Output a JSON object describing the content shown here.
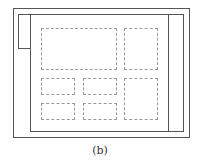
{
  "caption": "(b)",
  "colors": {
    "frame": "#555555",
    "dashed": "#999999",
    "background": "#ffffff"
  },
  "frames": {
    "outer": {
      "x": 13,
      "y": 8,
      "w": 177,
      "h": 130
    },
    "inner": {
      "x": 30,
      "y": 14,
      "w": 154,
      "h": 118
    },
    "tab": {
      "x": 18,
      "y": 14,
      "w": 13,
      "h": 35
    },
    "divider_x": 168
  },
  "dashed_boxes": [
    {
      "name": "large-block",
      "x": 41,
      "y": 28,
      "w": 76,
      "h": 42
    },
    {
      "name": "top-right-block",
      "x": 124,
      "y": 28,
      "w": 34,
      "h": 42
    },
    {
      "name": "row2-left-block",
      "x": 41,
      "y": 78,
      "w": 34,
      "h": 17
    },
    {
      "name": "row2-mid-block",
      "x": 83,
      "y": 78,
      "w": 34,
      "h": 17
    },
    {
      "name": "tall-right-block",
      "x": 124,
      "y": 78,
      "w": 34,
      "h": 42
    },
    {
      "name": "row3-left-block",
      "x": 41,
      "y": 103,
      "w": 34,
      "h": 17
    },
    {
      "name": "row3-mid-block",
      "x": 83,
      "y": 103,
      "w": 34,
      "h": 17
    }
  ]
}
